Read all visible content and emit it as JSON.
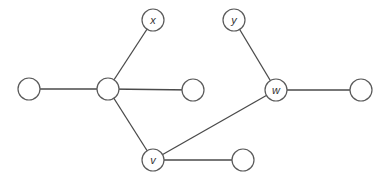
{
  "diagram": {
    "type": "graph",
    "directed": false,
    "colors": {
      "background": "#ffffff",
      "node_stroke": "#5a5a5a",
      "edge_stroke": "#4a4a4a",
      "label": "#333333"
    },
    "node_radius": 11,
    "nodes": [
      {
        "id": "left",
        "label": "",
        "x": 29,
        "y": 89
      },
      {
        "id": "hub",
        "label": "",
        "x": 108,
        "y": 89
      },
      {
        "id": "x",
        "label": "x",
        "x": 153,
        "y": 20
      },
      {
        "id": "mid",
        "label": "",
        "x": 193,
        "y": 90
      },
      {
        "id": "v",
        "label": "v",
        "x": 153,
        "y": 160
      },
      {
        "id": "bottom-right",
        "label": "",
        "x": 243,
        "y": 160
      },
      {
        "id": "y",
        "label": "y",
        "x": 234,
        "y": 20
      },
      {
        "id": "w",
        "label": "w",
        "x": 276,
        "y": 90
      },
      {
        "id": "right",
        "label": "",
        "x": 361,
        "y": 90
      }
    ],
    "edges": [
      {
        "from": "left",
        "to": "hub"
      },
      {
        "from": "hub",
        "to": "x"
      },
      {
        "from": "hub",
        "to": "mid"
      },
      {
        "from": "hub",
        "to": "v"
      },
      {
        "from": "v",
        "to": "bottom-right"
      },
      {
        "from": "v",
        "to": "w"
      },
      {
        "from": "y",
        "to": "w"
      },
      {
        "from": "w",
        "to": "right"
      }
    ]
  }
}
